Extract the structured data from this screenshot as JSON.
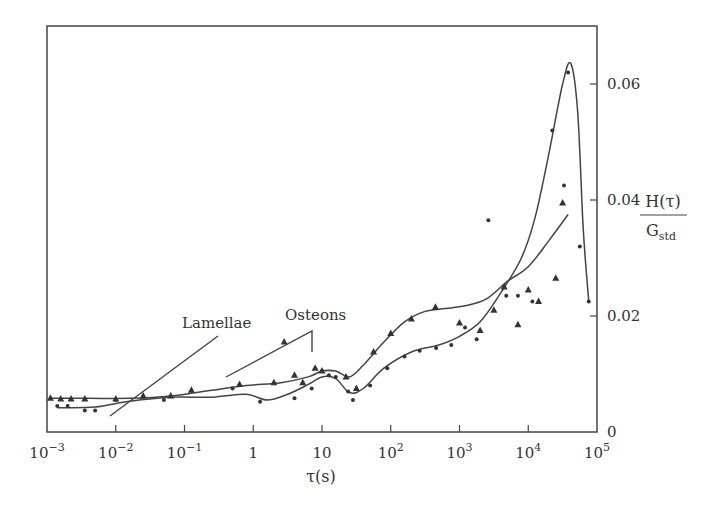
{
  "chart_data": {
    "type": "scatter",
    "title": "",
    "xlabel": "τ(s)",
    "ylabel": "H(τ)/G_std",
    "ylabel_numerator": "H(τ)",
    "ylabel_denominator_base": "G",
    "ylabel_denominator_sub": "std",
    "xscale": "log",
    "xlim": [
      0.001,
      100000
    ],
    "ylim": [
      0,
      0.068
    ],
    "y_axis_position": "right",
    "grid": false,
    "x_ticks": [
      {
        "exp": -3,
        "base": "10",
        "sup": "−3"
      },
      {
        "exp": -2,
        "base": "10",
        "sup": "−2"
      },
      {
        "exp": -1,
        "base": "10",
        "sup": "−1"
      },
      {
        "exp": 0,
        "base": "1",
        "sup": ""
      },
      {
        "exp": 1,
        "base": "10",
        "sup": ""
      },
      {
        "exp": 2,
        "base": "10",
        "sup": "2"
      },
      {
        "exp": 3,
        "base": "10",
        "sup": "3"
      },
      {
        "exp": 4,
        "base": "10",
        "sup": "4"
      },
      {
        "exp": 5,
        "base": "10",
        "sup": "5"
      }
    ],
    "y_ticks": [
      {
        "value": 0,
        "label": "0"
      },
      {
        "value": 0.02,
        "label": "0.02"
      },
      {
        "value": 0.04,
        "label": "0.04"
      },
      {
        "value": 0.06,
        "label": "0.06"
      }
    ],
    "annotations": [
      {
        "text": "Lamellae",
        "x_log": -1.5,
        "y": 0.02
      },
      {
        "text": "Osteons",
        "x_log": 0.55,
        "y": 0.021
      }
    ],
    "series": [
      {
        "name": "Osteons (dots)",
        "marker": "dot",
        "points_log": [
          [
            -2.85,
            0.0045
          ],
          [
            -2.7,
            0.0045
          ],
          [
            -2.45,
            0.0037
          ],
          [
            -2.3,
            0.0037
          ],
          [
            -2.0,
            0.0055
          ],
          [
            -1.3,
            0.0055
          ],
          [
            -0.3,
            0.0075
          ],
          [
            0.1,
            0.0052
          ],
          [
            0.6,
            0.0058
          ],
          [
            0.85,
            0.0075
          ],
          [
            1.0,
            0.0105
          ],
          [
            1.1,
            0.0098
          ],
          [
            1.2,
            0.0095
          ],
          [
            1.38,
            0.007
          ],
          [
            1.45,
            0.0055
          ],
          [
            1.7,
            0.008
          ],
          [
            1.95,
            0.011
          ],
          [
            2.2,
            0.013
          ],
          [
            2.42,
            0.014
          ],
          [
            2.66,
            0.0145
          ],
          [
            2.88,
            0.015
          ],
          [
            3.08,
            0.018
          ],
          [
            3.25,
            0.016
          ],
          [
            3.42,
            0.0365
          ],
          [
            3.68,
            0.0235
          ],
          [
            3.85,
            0.0235
          ],
          [
            4.06,
            0.0225
          ],
          [
            4.35,
            0.052
          ],
          [
            4.52,
            0.0425
          ],
          [
            4.58,
            0.062
          ],
          [
            4.75,
            0.032
          ],
          [
            4.88,
            0.0225
          ]
        ],
        "curve_log": [
          [
            -2.85,
            0.0042
          ],
          [
            -2.3,
            0.0043
          ],
          [
            -1.8,
            0.0053
          ],
          [
            -1.2,
            0.006
          ],
          [
            -0.6,
            0.006
          ],
          [
            -0.1,
            0.0065
          ],
          [
            0.2,
            0.0055
          ],
          [
            0.5,
            0.0065
          ],
          [
            0.8,
            0.0082
          ],
          [
            1.0,
            0.0095
          ],
          [
            1.2,
            0.0092
          ],
          [
            1.4,
            0.0068
          ],
          [
            1.6,
            0.0075
          ],
          [
            1.9,
            0.011
          ],
          [
            2.3,
            0.0138
          ],
          [
            2.7,
            0.015
          ],
          [
            3.0,
            0.0165
          ],
          [
            3.3,
            0.019
          ],
          [
            3.6,
            0.024
          ],
          [
            3.9,
            0.03
          ],
          [
            4.1,
            0.037
          ],
          [
            4.3,
            0.048
          ],
          [
            4.5,
            0.06
          ],
          [
            4.62,
            0.0635
          ],
          [
            4.72,
            0.055
          ],
          [
            4.8,
            0.035
          ],
          [
            4.88,
            0.0225
          ]
        ]
      },
      {
        "name": "Lamellae (triangles)",
        "marker": "triangle",
        "points_log": [
          [
            -2.95,
            0.0058
          ],
          [
            -2.8,
            0.0057
          ],
          [
            -2.65,
            0.0057
          ],
          [
            -2.45,
            0.0057
          ],
          [
            -2.0,
            0.0057
          ],
          [
            -1.6,
            0.0062
          ],
          [
            -1.2,
            0.0062
          ],
          [
            -0.9,
            0.0072
          ],
          [
            -0.2,
            0.0082
          ],
          [
            0.3,
            0.0085
          ],
          [
            0.6,
            0.0098
          ],
          [
            0.72,
            0.0085
          ],
          [
            0.9,
            0.011
          ],
          [
            1.0,
            0.0105
          ],
          [
            1.35,
            0.0095
          ],
          [
            1.5,
            0.0075
          ],
          [
            1.75,
            0.0138
          ],
          [
            2.0,
            0.017
          ],
          [
            2.3,
            0.0195
          ],
          [
            2.65,
            0.0215
          ],
          [
            3.0,
            0.0188
          ],
          [
            3.3,
            0.0175
          ],
          [
            3.5,
            0.021
          ],
          [
            3.65,
            0.025
          ],
          [
            3.85,
            0.0185
          ],
          [
            4.0,
            0.0245
          ],
          [
            4.15,
            0.0225
          ],
          [
            4.4,
            0.0265
          ],
          [
            4.5,
            0.0395
          ],
          [
            0.45,
            0.0155
          ]
        ],
        "curve_log": [
          [
            -2.95,
            0.0058
          ],
          [
            -2.4,
            0.0058
          ],
          [
            -1.8,
            0.0058
          ],
          [
            -1.2,
            0.0062
          ],
          [
            -0.6,
            0.0072
          ],
          [
            -0.1,
            0.008
          ],
          [
            0.4,
            0.0085
          ],
          [
            0.8,
            0.0095
          ],
          [
            1.0,
            0.0105
          ],
          [
            1.2,
            0.0105
          ],
          [
            1.4,
            0.0095
          ],
          [
            1.6,
            0.0115
          ],
          [
            1.9,
            0.0155
          ],
          [
            2.2,
            0.019
          ],
          [
            2.5,
            0.0208
          ],
          [
            2.8,
            0.0213
          ],
          [
            3.1,
            0.0218
          ],
          [
            3.4,
            0.023
          ],
          [
            3.7,
            0.026
          ],
          [
            4.0,
            0.0285
          ],
          [
            4.3,
            0.033
          ],
          [
            4.58,
            0.0375
          ]
        ]
      }
    ]
  }
}
